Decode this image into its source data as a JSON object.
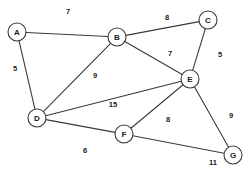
{
  "diagram": {
    "type": "node-link-graph",
    "width": 252,
    "height": 177,
    "background_color": "#ffffff",
    "stroke_color": "#3a3a3a",
    "node_fill_color": "#ffffff",
    "text_color": "#1a1a1a",
    "node_radius": 9,
    "nodes": [
      {
        "id": "A",
        "label": "A",
        "x": 17,
        "y": 32
      },
      {
        "id": "B",
        "label": "B",
        "x": 117,
        "y": 37
      },
      {
        "id": "C",
        "label": "C",
        "x": 208,
        "y": 20
      },
      {
        "id": "D",
        "label": "D",
        "x": 37,
        "y": 118
      },
      {
        "id": "E",
        "label": "E",
        "x": 190,
        "y": 79
      },
      {
        "id": "F",
        "label": "F",
        "x": 124,
        "y": 134
      },
      {
        "id": "G",
        "label": "G",
        "x": 233,
        "y": 155
      }
    ],
    "edges": [
      {
        "from": "A",
        "to": "B",
        "weight": "7",
        "label_x": 68,
        "label_y": 11
      },
      {
        "from": "A",
        "to": "D",
        "weight": "5",
        "label_x": 15,
        "label_y": 68
      },
      {
        "from": "B",
        "to": "C",
        "weight": "8",
        "label_x": 167,
        "label_y": 17
      },
      {
        "from": "B",
        "to": "D",
        "weight": "9",
        "label_x": 95,
        "label_y": 75
      },
      {
        "from": "B",
        "to": "E",
        "weight": "7",
        "label_x": 170,
        "label_y": 53
      },
      {
        "from": "C",
        "to": "E",
        "weight": "5",
        "label_x": 220,
        "label_y": 54
      },
      {
        "from": "D",
        "to": "E",
        "weight": "15",
        "label_x": 113,
        "label_y": 104
      },
      {
        "from": "D",
        "to": "F",
        "weight": "6",
        "label_x": 85,
        "label_y": 150
      },
      {
        "from": "E",
        "to": "F",
        "weight": "8",
        "label_x": 168,
        "label_y": 119
      },
      {
        "from": "E",
        "to": "G",
        "weight": "9",
        "label_x": 231,
        "label_y": 115
      },
      {
        "from": "F",
        "to": "G",
        "weight": "11",
        "label_x": 213,
        "label_y": 162
      }
    ]
  }
}
